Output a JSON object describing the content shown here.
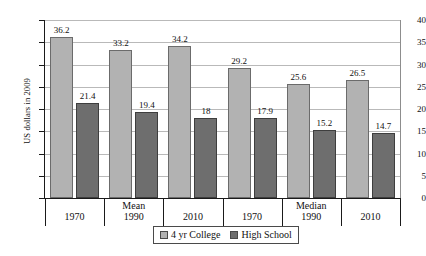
{
  "chart_data": {
    "type": "bar",
    "title": "",
    "xlabel": "",
    "ylabel": "US dollars in 2009",
    "ylim": [
      0,
      40
    ],
    "ytick_step": 5,
    "yticks": [
      0,
      5,
      10,
      15,
      20,
      25,
      30,
      35,
      40
    ],
    "grid": true,
    "legend_position": "bottom-center",
    "categories": [
      "1970",
      "1990",
      "2010",
      "1970",
      "1990",
      "2010"
    ],
    "group_labels": [
      "",
      "Mean",
      "",
      "",
      "Median",
      ""
    ],
    "groups": [
      {
        "name": "Mean",
        "categories": [
          "1970",
          "1990",
          "2010"
        ]
      },
      {
        "name": "Median",
        "categories": [
          "1970",
          "1990",
          "2010"
        ]
      }
    ],
    "series": [
      {
        "name": "4 yr College",
        "color": "#b2b2b2",
        "values": [
          36.2,
          33.2,
          34.2,
          29.2,
          25.6,
          26.5
        ],
        "labels": [
          "36.2",
          "33.2",
          "34.2",
          "29.2",
          "25.6",
          "26.5"
        ]
      },
      {
        "name": "High School",
        "color": "#6e6e6e",
        "values": [
          21.4,
          19.4,
          18,
          17.9,
          15.2,
          14.7
        ],
        "labels": [
          "21.4",
          "19.4",
          "18",
          "17.9",
          "15.2",
          "14.7"
        ]
      }
    ]
  },
  "axis": {
    "y_title": "US dollars in 2009",
    "y_labels": [
      "40",
      "35",
      "30",
      "25",
      "20",
      "15",
      "10",
      "5",
      "0"
    ],
    "x_labels": [
      {
        "stat": "",
        "year": "1970"
      },
      {
        "stat": "Mean",
        "year": "1990"
      },
      {
        "stat": "",
        "year": "2010"
      },
      {
        "stat": "",
        "year": "1970"
      },
      {
        "stat": "Median",
        "year": "1990"
      },
      {
        "stat": "",
        "year": "2010"
      }
    ]
  },
  "legend": {
    "items": [
      {
        "label": "4 yr College",
        "color": "#b2b2b2"
      },
      {
        "label": "High School",
        "color": "#6e6e6e"
      }
    ]
  }
}
